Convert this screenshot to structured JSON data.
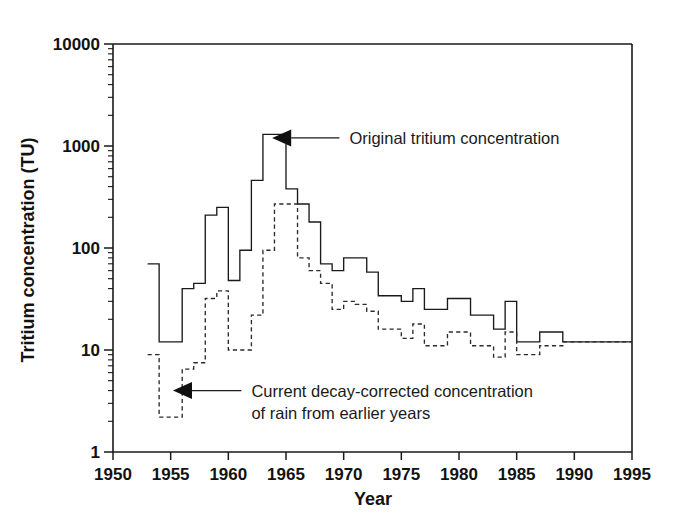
{
  "chart_data": {
    "type": "line",
    "title": "",
    "xlabel": "Year",
    "ylabel": "Tritium concentration (TU)",
    "yscale": "log",
    "xlim": [
      1950,
      1995
    ],
    "ylim": [
      1,
      10000
    ],
    "grid": false,
    "legend_position": "inline-annotations",
    "xticks": [
      1950,
      1955,
      1960,
      1965,
      1970,
      1975,
      1980,
      1985,
      1990,
      1995
    ],
    "xticklabels": [
      "1950",
      "1955",
      "1960",
      "1965",
      "1970",
      "1975",
      "1980",
      "1985",
      "1990",
      "1995"
    ],
    "yticks": [
      1,
      10,
      100,
      1000,
      10000
    ],
    "yticklabels": [
      "1",
      "10",
      "100",
      "1000",
      "10000"
    ],
    "series": [
      {
        "name": "Original tritium concentration",
        "style": "solid",
        "step": "post",
        "x": [
          1953,
          1954,
          1955,
          1956,
          1957,
          1958,
          1959,
          1960,
          1961,
          1962,
          1963,
          1964,
          1965,
          1966,
          1967,
          1968,
          1969,
          1970,
          1971,
          1972,
          1973,
          1974,
          1975,
          1976,
          1977,
          1978,
          1979,
          1980,
          1981,
          1982,
          1983,
          1984,
          1985,
          1986,
          1987,
          1988,
          1989,
          1990,
          1991,
          1992,
          1993,
          1994,
          1995
        ],
        "values": [
          70,
          12,
          12,
          40,
          45,
          210,
          250,
          48,
          95,
          460,
          1300,
          1300,
          380,
          270,
          180,
          70,
          60,
          80,
          80,
          58,
          34,
          34,
          30,
          40,
          25,
          25,
          32,
          32,
          22,
          22,
          16,
          30,
          12,
          12,
          15,
          15,
          12,
          12,
          12,
          12,
          12,
          12,
          12
        ]
      },
      {
        "name": "Current decay-corrected concentration of rain from earlier years",
        "style": "dashed",
        "step": "post",
        "x": [
          1953,
          1954,
          1955,
          1956,
          1957,
          1958,
          1959,
          1960,
          1961,
          1962,
          1963,
          1964,
          1965,
          1966,
          1967,
          1968,
          1969,
          1970,
          1971,
          1972,
          1973,
          1974,
          1975,
          1976,
          1977,
          1978,
          1979,
          1980,
          1981,
          1982,
          1983,
          1984,
          1985,
          1986,
          1987,
          1988,
          1989,
          1990,
          1991,
          1992,
          1993,
          1994,
          1995
        ],
        "values": [
          9,
          2.2,
          2.2,
          6.5,
          7.5,
          32,
          38,
          10,
          10,
          22,
          95,
          270,
          270,
          80,
          60,
          45,
          25,
          30,
          28,
          24,
          16,
          16,
          13,
          18,
          11,
          11,
          15,
          15,
          11,
          11,
          8.5,
          15,
          9,
          9,
          11,
          11,
          12,
          12,
          12,
          12,
          12,
          12,
          12
        ]
      }
    ],
    "annotations": [
      {
        "id": "original-annotation",
        "text_lines": [
          "Original tritium concentration"
        ],
        "text_x": 1970.5,
        "text_y": 1200,
        "arrow_tip_x": 1963.8,
        "arrow_tip_y": 1200
      },
      {
        "id": "decay-corrected-annotation",
        "text_lines": [
          "Current decay-corrected concentration",
          "of rain from earlier years"
        ],
        "text_x": 1962.0,
        "text_y": 4.0,
        "arrow_tip_x": 1955.2,
        "arrow_tip_y": 4.0
      }
    ]
  }
}
